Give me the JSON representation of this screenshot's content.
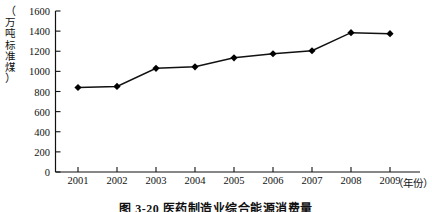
{
  "chart_data": {
    "type": "line",
    "title": "图 3-20  医药制造业综合能源消费量",
    "xlabel": "（年份）",
    "ylabel": "（万吨标准煤）",
    "categories": [
      "2001",
      "2002",
      "2003",
      "2004",
      "2005",
      "2006",
      "2007",
      "2008",
      "2009"
    ],
    "values": [
      840,
      850,
      1030,
      1045,
      1135,
      1175,
      1205,
      1385,
      1375
    ],
    "series": [
      {
        "name": "医药制造业综合能源消费量",
        "values": [
          840,
          850,
          1030,
          1045,
          1135,
          1175,
          1205,
          1385,
          1375
        ]
      }
    ],
    "ylim": [
      0,
      1600
    ],
    "ytick_values": [
      0,
      200,
      400,
      600,
      800,
      1000,
      1200,
      1400,
      1600
    ],
    "ytick_labels": [
      "0",
      "200",
      "400",
      "600",
      "800",
      "1000",
      "1200",
      "1400",
      "1600"
    ],
    "grid": false,
    "legend": false,
    "marker": "diamond",
    "line_color": "#111111",
    "marker_color": "#000000"
  },
  "axis": {
    "y_unit_chars": [
      "（",
      "万",
      "吨",
      "标",
      "准",
      "煤",
      "）"
    ],
    "x_unit": "（年份）"
  },
  "caption": {
    "figure_number": "图 3-20",
    "text": "图 3-20  医药制造业综合能源消费量"
  }
}
